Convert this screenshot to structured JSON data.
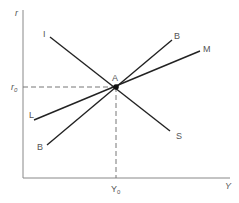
{
  "diagram": {
    "type": "IS-LM-BP equilibrium diagram",
    "axes": {
      "y_label": "r",
      "x_label": "Y",
      "y_tick_label": "r",
      "y_tick_sub": "0",
      "x_tick_label": "Y",
      "x_tick_sub": "0"
    },
    "equilibrium": {
      "label": "A"
    },
    "curves": [
      {
        "name": "IS",
        "start_label": "I",
        "end_label": "S"
      },
      {
        "name": "LM",
        "start_label": "L",
        "end_label": "M"
      },
      {
        "name": "BB",
        "start_label": "B",
        "end_label": "B"
      }
    ],
    "colors": {
      "line": "#222222",
      "axis": "#777777",
      "dashed": "#777777",
      "text": "#555555"
    }
  }
}
